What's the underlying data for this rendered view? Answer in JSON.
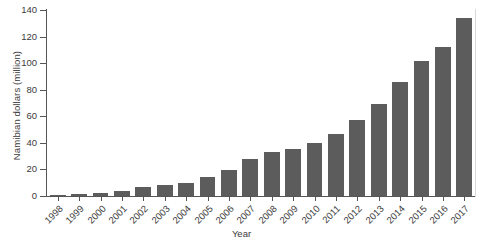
{
  "chart_data": {
    "type": "bar",
    "title": "",
    "subtitle": "",
    "xlabel": "Year",
    "ylabel": "Namibian dollars (million)",
    "categories": [
      "1998",
      "1999",
      "2000",
      "2001",
      "2002",
      "2003",
      "2004",
      "2005",
      "2006",
      "2007",
      "2008",
      "2009",
      "2010",
      "2011",
      "2012",
      "2013",
      "2014",
      "2015",
      "2016",
      "2017"
    ],
    "values": [
      0.7,
      1.5,
      2,
      3.5,
      7,
      8.5,
      9.5,
      14,
      19.5,
      27.5,
      33,
      35.5,
      40,
      47,
      57,
      69,
      86,
      102,
      112,
      134
    ],
    "series": [
      {
        "name": "Namibian dollars (million)",
        "values": [
          0.7,
          1.5,
          2,
          3.5,
          7,
          8.5,
          9.5,
          14,
          19.5,
          27.5,
          33,
          35.5,
          40,
          47,
          57,
          69,
          86,
          102,
          112,
          134
        ]
      }
    ],
    "ylim": [
      0,
      140
    ],
    "yticks": [
      0,
      20,
      40,
      60,
      80,
      100,
      120,
      140
    ],
    "ytick_labels": [
      "0",
      "20",
      "40",
      "60",
      "80",
      "100",
      "120",
      "140"
    ],
    "grid": false,
    "legend": false,
    "legend_position": "none",
    "bar_color": "#5c5c5c",
    "axis_color": "#555555",
    "text_color": "#3b3b3b",
    "background_color": "#ffffff"
  }
}
